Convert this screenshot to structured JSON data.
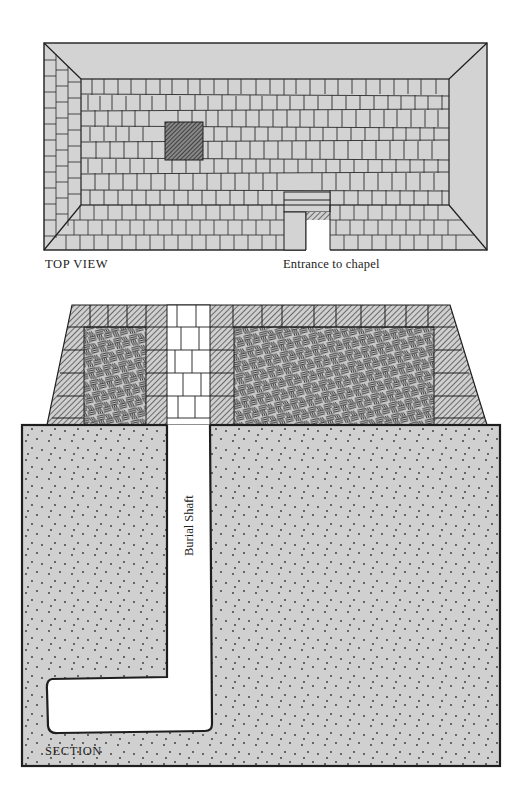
{
  "figure": {
    "top_view": {
      "label": "TOP VIEW",
      "entrance_label": "Entrance to chapel"
    },
    "section": {
      "label": "SECTION",
      "shaft_label": "Burial Shaft"
    },
    "colors": {
      "stone_fill": "#d3d3d3",
      "ground_fill": "#d0d0d0",
      "ink": "#1e1e1e",
      "hatch_dark": "#555555",
      "void": "#ffffff"
    }
  }
}
